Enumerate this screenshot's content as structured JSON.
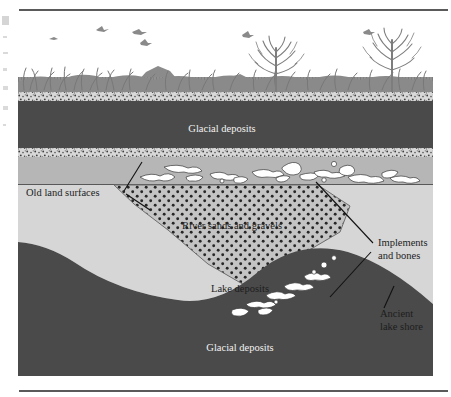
{
  "figure": {
    "type": "geological-cross-section",
    "title_visible": false,
    "frame": {
      "top_rule": true,
      "bottom_rule": true
    },
    "colors": {
      "sky": "#ffffff",
      "vegetation": "#8e8e8e",
      "speckled_band": "#c9c9c9",
      "glacial_deposits": "#4a4a4a",
      "old_land_fill": "#b5b5b5",
      "lake_deposits": "#d4d4d4",
      "river_gravels": "#c2c2c2",
      "gravel_dots": "#2b2b2b",
      "artifact": "#ffffff",
      "leader_line": "#111111",
      "rule": "#5a5a5a"
    },
    "labels": [
      {
        "id": "glacial-deposits-upper",
        "text": "Glacial deposits",
        "tone": "light",
        "x": 204,
        "y": 128
      },
      {
        "id": "old-land-surfaces",
        "text": "Old land surfaces",
        "tone": "dark",
        "x": 28,
        "y": 182,
        "leader": true
      },
      {
        "id": "river-sands-and-gravels",
        "text": "River sands and gravels",
        "tone": "dark",
        "x": 176,
        "y": 222
      },
      {
        "id": "implements-and-bones-line1",
        "text": "Implements",
        "tone": "dark",
        "x": 362,
        "y": 228,
        "leader": true
      },
      {
        "id": "implements-and-bones-line2",
        "text": "and bones",
        "tone": "dark",
        "x": 362,
        "y": 241
      },
      {
        "id": "lake-deposits",
        "text": "Lake deposits",
        "tone": "dark",
        "x": 203,
        "y": 286
      },
      {
        "id": "ancient-lake-shore-line1",
        "text": "Ancient",
        "tone": "dark",
        "x": 364,
        "y": 303,
        "leader": true
      },
      {
        "id": "ancient-lake-shore-line2",
        "text": "lake shore",
        "tone": "dark",
        "x": 364,
        "y": 316
      },
      {
        "id": "glacial-deposits-lower",
        "text": "Glacial deposits",
        "tone": "light",
        "x": 193,
        "y": 346
      }
    ],
    "strata": [
      {
        "id": "vegetation-surface",
        "name": "Vegetation and modern land surface"
      },
      {
        "id": "speckled-band-upper",
        "name": "Upper speckled soil band"
      },
      {
        "id": "glacial-deposits-upper-layer",
        "name": "Glacial deposits"
      },
      {
        "id": "speckled-band-lower",
        "name": "Lower speckled soil band"
      },
      {
        "id": "old-land-surface-layer",
        "name": "Old land surface"
      },
      {
        "id": "lake-deposits-layer",
        "name": "Lake deposits"
      },
      {
        "id": "river-gravel-lens",
        "name": "River sands and gravels"
      },
      {
        "id": "glacial-deposits-lower-layer",
        "name": "Glacial deposits"
      }
    ],
    "scene": {
      "birds_count": 6,
      "trees_count": 2,
      "hills_count": 2
    }
  }
}
